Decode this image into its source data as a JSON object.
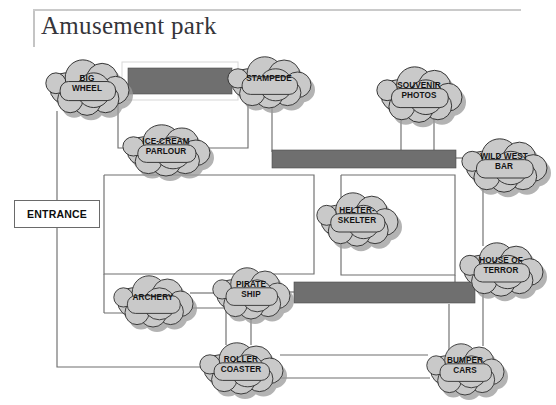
{
  "page": {
    "title": "Amusement park",
    "background_color": "#ffffff",
    "frame_color": "#bdbdbd"
  },
  "entrance": {
    "label": "ENTRANCE"
  },
  "colors": {
    "cloud_fill": "#c9c9c9",
    "cloud_outline": "#2b2b2b",
    "cloud_shadow": "#9a9a9a",
    "path_bar_fill": "#6f6f6f",
    "connector": "#6e6e6e",
    "title_text": "#35353a",
    "label_text": "#141414"
  },
  "attractions": [
    {
      "id": "big-wheel",
      "label": "BIG\nWHEEL",
      "cx": 87,
      "cy": 85,
      "rx": 42,
      "ry": 26
    },
    {
      "id": "stampede",
      "label": "STAMPEDE",
      "cx": 269,
      "cy": 80,
      "rx": 42,
      "ry": 24
    },
    {
      "id": "souvenir-photos",
      "label": "SOUVENIR\nPHOTOS",
      "cx": 419,
      "cy": 92,
      "rx": 43,
      "ry": 26
    },
    {
      "id": "ice-cream-parlour",
      "label": "ICE-CREAM\nPARLOUR",
      "cx": 166,
      "cy": 148,
      "rx": 44,
      "ry": 24
    },
    {
      "id": "wild-west-bar",
      "label": "WILD WEST\nBAR",
      "cx": 504,
      "cy": 163,
      "rx": 43,
      "ry": 25
    },
    {
      "id": "helter-skelter",
      "label": "HELTER-\nSKELTER",
      "cx": 357,
      "cy": 217,
      "rx": 41,
      "ry": 25
    },
    {
      "id": "house-of-terror",
      "label": "HOUSE OF\nTERROR",
      "cx": 501,
      "cy": 267,
      "rx": 42,
      "ry": 25
    },
    {
      "id": "archery",
      "label": "ARCHERY",
      "cx": 153,
      "cy": 299,
      "rx": 40,
      "ry": 24
    },
    {
      "id": "pirate-ship",
      "label": "PIRATE\nSHIP",
      "cx": 251,
      "cy": 291,
      "rx": 39,
      "ry": 24
    },
    {
      "id": "roller-coaster",
      "label": "ROLLER\nCOASTER",
      "cx": 241,
      "cy": 366,
      "rx": 42,
      "ry": 24
    },
    {
      "id": "bumper-cars",
      "label": "BUMPER\nCARS",
      "cx": 465,
      "cy": 367,
      "rx": 39,
      "ry": 24
    }
  ],
  "path_bars": [
    {
      "id": "path-bar-top",
      "x": 126,
      "y": 66,
      "w": 108,
      "h": 30
    },
    {
      "id": "path-bar-middle",
      "x": 272,
      "y": 150,
      "w": 184,
      "h": 19
    },
    {
      "id": "path-bar-lower",
      "x": 294,
      "y": 282,
      "w": 181,
      "h": 22
    }
  ]
}
